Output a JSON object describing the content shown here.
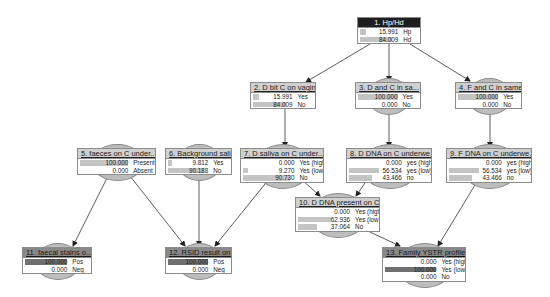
{
  "diagram": {
    "type": "bayesian-network",
    "nodes": [
      {
        "id": "1",
        "title": "1. Hp/Hd",
        "style": "dark",
        "x": 357,
        "y": 17,
        "w": 64,
        "states": [
          {
            "value": "15.991",
            "label": "Hp",
            "pct": 15.991
          },
          {
            "value": "84.009",
            "label": "Hd",
            "pct": 84.009
          }
        ]
      },
      {
        "id": "2",
        "title": "2. D bit C on vagina",
        "style": "light",
        "x": 250,
        "y": 82,
        "w": 66,
        "states": [
          {
            "value": "15.991",
            "label": "Yes",
            "pct": 15.991
          },
          {
            "value": "84.009",
            "label": "No",
            "pct": 84.009
          }
        ]
      },
      {
        "id": "3",
        "title": "3. D and C in sa...",
        "style": "light",
        "x": 355,
        "y": 82,
        "w": 66,
        "states": [
          {
            "value": "100.000",
            "label": "Yes",
            "pct": 100
          },
          {
            "value": "0.000",
            "label": "No",
            "pct": 0
          }
        ]
      },
      {
        "id": "4",
        "title": "4. F and C in same...",
        "style": "light",
        "x": 455,
        "y": 82,
        "w": 67,
        "states": [
          {
            "value": "100.000",
            "label": "Yes",
            "pct": 100
          },
          {
            "value": "0.000",
            "label": "No",
            "pct": 0
          }
        ]
      },
      {
        "id": "5",
        "title": "5. faeces on C under...",
        "style": "light",
        "x": 77,
        "y": 148,
        "w": 79,
        "states": [
          {
            "value": "100.000",
            "label": "Present",
            "pct": 100
          },
          {
            "value": "0.000",
            "label": "Absent",
            "pct": 0
          }
        ]
      },
      {
        "id": "6",
        "title": "6. Background sali...",
        "style": "light",
        "x": 165,
        "y": 148,
        "w": 67,
        "states": [
          {
            "value": "9.812",
            "label": "Yes",
            "pct": 9.812
          },
          {
            "value": "90.188",
            "label": "No",
            "pct": 90.188
          }
        ]
      },
      {
        "id": "7",
        "title": "7. D saliva on C under...",
        "style": "light",
        "x": 240,
        "y": 148,
        "w": 84,
        "states": [
          {
            "value": "0.000",
            "label": "Yes (high)",
            "pct": 0
          },
          {
            "value": "9.270",
            "label": "Yes (low)",
            "pct": 9.27
          },
          {
            "value": "90.730",
            "label": "No",
            "pct": 90.73
          }
        ]
      },
      {
        "id": "8",
        "title": "8. D DNA on C underwe...",
        "style": "light",
        "x": 346,
        "y": 148,
        "w": 86,
        "states": [
          {
            "value": "0.000",
            "label": "yes (high)",
            "pct": 0
          },
          {
            "value": "56.534",
            "label": "yes (low)",
            "pct": 56.534
          },
          {
            "value": "43.466",
            "label": "no",
            "pct": 43.466
          }
        ]
      },
      {
        "id": "9",
        "title": "9. F DNA on C underwe...",
        "style": "light",
        "x": 446,
        "y": 148,
        "w": 86,
        "states": [
          {
            "value": "0.000",
            "label": "yes (high)",
            "pct": 0
          },
          {
            "value": "56.534",
            "label": "yes (low)",
            "pct": 56.534
          },
          {
            "value": "43.466",
            "label": "no",
            "pct": 43.466
          }
        ]
      },
      {
        "id": "10",
        "title": "10. D DNA present on C ...",
        "style": "light",
        "x": 295,
        "y": 197,
        "w": 85,
        "states": [
          {
            "value": "0.000",
            "label": "Yes (high)",
            "pct": 0
          },
          {
            "value": "62.936",
            "label": "Yes (low)",
            "pct": 62.936
          },
          {
            "value": "37.064",
            "label": "No",
            "pct": 37.064
          }
        ]
      },
      {
        "id": "11",
        "title": "11. faecal stains o...",
        "style": "mid",
        "x": 22,
        "y": 247,
        "w": 70,
        "states": [
          {
            "value": "100.000",
            "label": "Pos",
            "pct": 100,
            "dark": true
          },
          {
            "value": "0.000",
            "label": "Neg",
            "pct": 0
          }
        ]
      },
      {
        "id": "12",
        "title": "12. RSID result on...",
        "style": "mid",
        "x": 165,
        "y": 247,
        "w": 67,
        "states": [
          {
            "value": "100.000",
            "label": "Pos",
            "pct": 100,
            "dark": true
          },
          {
            "value": "0.000",
            "label": "Neg",
            "pct": 0
          }
        ]
      },
      {
        "id": "13",
        "title": "13. Family YSTR profile",
        "style": "mid",
        "x": 382,
        "y": 247,
        "w": 84,
        "states": [
          {
            "value": "0.000",
            "label": "Yes (high)",
            "pct": 0
          },
          {
            "value": "100.000",
            "label": "Yes (low)",
            "pct": 100,
            "dark": true
          },
          {
            "value": "0.000",
            "label": "No",
            "pct": 0
          }
        ]
      }
    ],
    "edges": [
      {
        "from": "1",
        "to": "2",
        "x1": 370,
        "y1": 44,
        "x2": 306,
        "y2": 82
      },
      {
        "from": "1",
        "to": "3",
        "x1": 389,
        "y1": 44,
        "x2": 389,
        "y2": 81
      },
      {
        "from": "1",
        "to": "4",
        "x1": 410,
        "y1": 44,
        "x2": 470,
        "y2": 81
      },
      {
        "from": "2",
        "to": "7",
        "x1": 285,
        "y1": 109,
        "x2": 285,
        "y2": 147
      },
      {
        "from": "3",
        "to": "8",
        "x1": 389,
        "y1": 109,
        "x2": 389,
        "y2": 147
      },
      {
        "from": "4",
        "to": "9",
        "x1": 490,
        "y1": 109,
        "x2": 490,
        "y2": 147
      },
      {
        "from": "5",
        "to": "11",
        "x1": 108,
        "y1": 176,
        "x2": 73,
        "y2": 246
      },
      {
        "from": "5",
        "to": "12",
        "x1": 130,
        "y1": 176,
        "x2": 185,
        "y2": 246
      },
      {
        "from": "6",
        "to": "12",
        "x1": 199,
        "y1": 180,
        "x2": 199,
        "y2": 246
      },
      {
        "from": "7",
        "to": "12",
        "x1": 269,
        "y1": 179,
        "x2": 215,
        "y2": 246
      },
      {
        "from": "7",
        "to": "10",
        "x1": 301,
        "y1": 179,
        "x2": 320,
        "y2": 196
      },
      {
        "from": "8",
        "to": "10",
        "x1": 367,
        "y1": 180,
        "x2": 356,
        "y2": 196
      },
      {
        "from": "9",
        "to": "13",
        "x1": 478,
        "y1": 180,
        "x2": 438,
        "y2": 246
      },
      {
        "from": "10",
        "to": "13",
        "x1": 370,
        "y1": 232,
        "x2": 400,
        "y2": 246
      }
    ]
  }
}
